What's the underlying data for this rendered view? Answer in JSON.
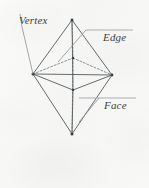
{
  "figure": {
    "background_color": "#f7f7f6",
    "ink_color": "#555a5e",
    "labels": {
      "vertex": "Vertex",
      "edge": "Edge",
      "face": "Face"
    }
  },
  "geometry": {
    "type": "octahedron",
    "description": "Regular octahedron drawn in oblique projection with hidden edges dashed",
    "vertices": [
      {
        "name": "top",
        "x": 72,
        "y": 20
      },
      {
        "name": "bottom",
        "x": 72,
        "y": 134
      },
      {
        "name": "left",
        "x": 33,
        "y": 74
      },
      {
        "name": "right",
        "x": 112,
        "y": 75
      },
      {
        "name": "front",
        "x": 73,
        "y": 90
      },
      {
        "name": "back",
        "x": 73,
        "y": 58
      }
    ],
    "solid_edges": [
      [
        "top",
        "left"
      ],
      [
        "top",
        "right"
      ],
      [
        "top",
        "front"
      ],
      [
        "bottom",
        "left"
      ],
      [
        "bottom",
        "right"
      ],
      [
        "bottom",
        "front"
      ],
      [
        "left",
        "front"
      ],
      [
        "right",
        "front"
      ]
    ],
    "hidden_edges": [
      [
        "top",
        "back"
      ],
      [
        "bottom",
        "back"
      ],
      [
        "left",
        "back"
      ],
      [
        "right",
        "back"
      ]
    ],
    "vertical_axis": [
      "top",
      "bottom"
    ],
    "marked_vertices": [
      "top",
      "bottom",
      "left",
      "right",
      "front",
      "back"
    ]
  },
  "annotations": [
    {
      "name": "vertex-callout",
      "label": "Vertex",
      "leader_from": {
        "x": 22,
        "y": 28
      },
      "leader_to": {
        "x": 33,
        "y": 74
      },
      "target_vertex": "left"
    },
    {
      "name": "edge-callout",
      "label": "Edge",
      "rule": {
        "x1": 86,
        "y1": 30,
        "x2": 133,
        "y2": 30
      },
      "leader_from": {
        "x": 86,
        "y": 30
      },
      "leader_to": {
        "x": 60,
        "y": 60
      },
      "target_edge": [
        "top",
        "left"
      ]
    },
    {
      "name": "face-callout",
      "label": "Face",
      "rule": {
        "x1": 79,
        "y1": 98,
        "x2": 136,
        "y2": 98
      },
      "leader_from": {
        "x": 100,
        "y": 98
      },
      "leader_to": {
        "x": 82,
        "y": 118
      },
      "target_face": "bottom-front-right"
    }
  ]
}
